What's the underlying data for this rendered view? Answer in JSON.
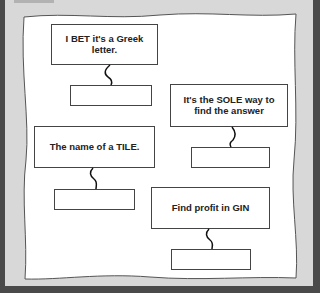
{
  "puzzle": {
    "clues": [
      {
        "id": 1,
        "text": "I BET it's a Greek letter.",
        "answer": ""
      },
      {
        "id": 2,
        "text": "It's the SOLE way to find the answer",
        "answer": ""
      },
      {
        "id": 3,
        "text": "The name of a TILE.",
        "answer": ""
      },
      {
        "id": 4,
        "text": "Find profit in GIN",
        "answer": ""
      }
    ]
  },
  "colors": {
    "background": "#d8d8d8",
    "frame": "#4a4a4a",
    "paper": "#ffffff",
    "border": "#444444"
  }
}
